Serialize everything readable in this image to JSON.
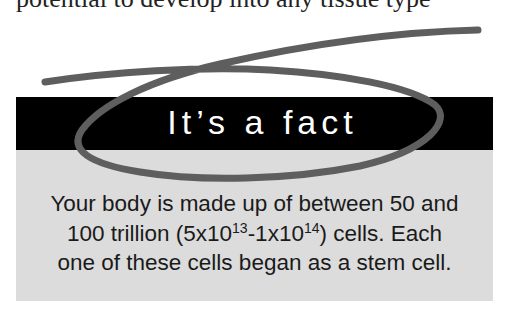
{
  "page": {
    "top_text": "potential to develop into any tissue type"
  },
  "fact_box": {
    "title": "It’s a fact",
    "lines": {
      "line1": "Your body is made up of between 50 and",
      "line2_pre": "100 trillion (5x10",
      "exp1": "13",
      "line2_mid": "-1x10",
      "exp2": "14",
      "line2_post": ") cells. Each",
      "line3": "one of these cells began as a stem cell."
    }
  },
  "annotation": {
    "type": "hand-drawn loop scribble",
    "color": "#5e5e5e"
  },
  "colors": {
    "header_bg": "#000000",
    "body_bg": "#dcdcdc",
    "title_text": "#ffffff",
    "body_text": "#1a1a1a"
  }
}
